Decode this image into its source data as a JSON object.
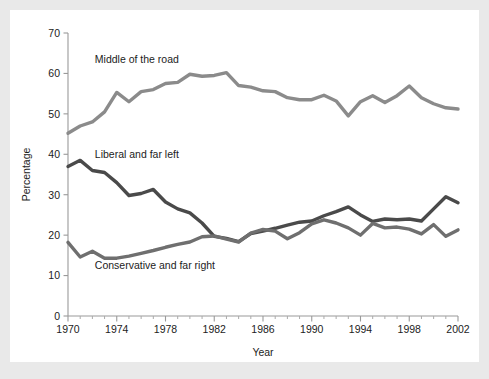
{
  "figure": {
    "background_color": "#e9e9e9",
    "plot_background_color": "#ffffff"
  },
  "chart_data": {
    "type": "line",
    "title": "",
    "subtitle": "",
    "xlabel": "Year",
    "ylabel": "Percentage",
    "xlim": [
      1970,
      2002
    ],
    "ylim": [
      0,
      70
    ],
    "ytick_values": [
      0,
      10,
      20,
      30,
      40,
      50,
      60,
      70
    ],
    "ytick_labels": [
      "0",
      "10",
      "20",
      "30",
      "40",
      "50",
      "60",
      "70"
    ],
    "xtick_values": [
      1970,
      1974,
      1978,
      1982,
      1986,
      1990,
      1994,
      1998,
      2002
    ],
    "xtick_labels": [
      "1970",
      "1974",
      "1978",
      "1982",
      "1986",
      "1990",
      "1994",
      "1998",
      "2002"
    ],
    "xtick_minor_step": 1,
    "grid": false,
    "legend_position": "inline-annotations",
    "x": [
      1970,
      1971,
      1972,
      1973,
      1974,
      1975,
      1976,
      1977,
      1978,
      1979,
      1980,
      1981,
      1982,
      1983,
      1984,
      1985,
      1986,
      1987,
      1988,
      1989,
      1990,
      1991,
      1992,
      1993,
      1994,
      1995,
      1996,
      1997,
      1998,
      1999,
      2000,
      2001,
      2002
    ],
    "series": [
      {
        "name": "Middle of the road",
        "color": "#8b8b8b",
        "label_x": 1972.2,
        "label_y": 62.5,
        "values": [
          45.2,
          47.0,
          48.0,
          50.5,
          55.3,
          53.0,
          55.5,
          56.0,
          57.5,
          57.8,
          59.8,
          59.3,
          59.5,
          60.2,
          57.0,
          56.6,
          55.7,
          55.5,
          54.0,
          53.5,
          53.5,
          54.6,
          53.2,
          49.5,
          53.0,
          54.5,
          52.8,
          54.5,
          56.9,
          54.0,
          52.5,
          51.5,
          51.2
        ]
      },
      {
        "name": "Liberal and far left",
        "color": "#4a4a4a",
        "label_x": 1972.2,
        "label_y": 39.0,
        "values": [
          37.0,
          38.5,
          36.0,
          35.5,
          33.0,
          29.8,
          30.3,
          31.3,
          28.2,
          26.5,
          25.5,
          23.0,
          19.7,
          19.2,
          18.4,
          20.4,
          21.0,
          21.7,
          22.5,
          23.2,
          23.5,
          24.8,
          25.8,
          27.0,
          25.0,
          23.4,
          24.0,
          23.8,
          24.0,
          23.5,
          26.5,
          29.5,
          28.0
        ]
      },
      {
        "name": "Conservative and far right",
        "color": "#6f6f6f",
        "label_x": 1972.2,
        "label_y": 11.6,
        "values": [
          18.2,
          14.6,
          16.0,
          14.3,
          14.3,
          14.8,
          15.5,
          16.2,
          17.0,
          17.7,
          18.3,
          19.6,
          19.8,
          19.0,
          18.3,
          20.5,
          21.4,
          21.0,
          19.1,
          20.6,
          22.8,
          23.8,
          23.0,
          21.8,
          20.0,
          22.9,
          21.8,
          22.0,
          21.5,
          20.3,
          22.6,
          19.7,
          21.3
        ]
      }
    ]
  }
}
